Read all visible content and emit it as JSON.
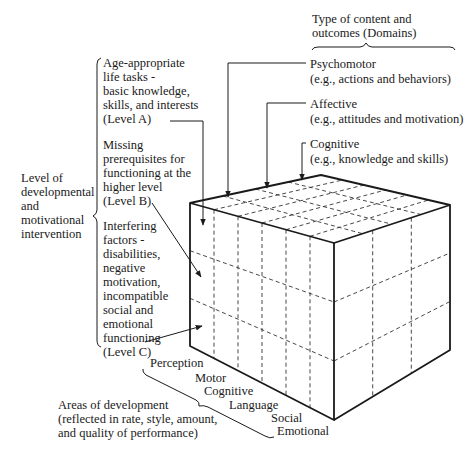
{
  "domains": {
    "heading": "Type of content and\noutcomes (Domains)",
    "items": [
      {
        "name": "Psychomotor",
        "example": "(e.g., actions and behaviors)"
      },
      {
        "name": "Affective",
        "example": "(e.g., attitudes and motivation)"
      },
      {
        "name": "Cognitive",
        "example": "(e.g., knowledge and skills)"
      }
    ]
  },
  "levels": {
    "heading": "Level of\ndevelopmental\nand\nmotivational\nintervention",
    "items": [
      {
        "text": "Age-appropriate\nlife tasks -\nbasic knowledge,\nskills, and interests\n(Level A)"
      },
      {
        "text": "Missing\nprerequisites for\nfunctioning at the\nhigher level\n(Level B)"
      },
      {
        "text": "Interfering\nfactors -\ndisabilities,\nnegative\nmotivation,\nincompatible\nsocial and\nemotional\nfunctioning\n(Level C)"
      }
    ]
  },
  "areas": {
    "heading": "Areas of development\n(reflected in rate, style, amount,\nand quality of performance)",
    "items": [
      "Perception",
      "Motor",
      "Cognitive",
      "Language",
      "Social",
      "Emotional"
    ]
  },
  "colors": {
    "line": "#1a1a1a",
    "dash": "#333333"
  }
}
